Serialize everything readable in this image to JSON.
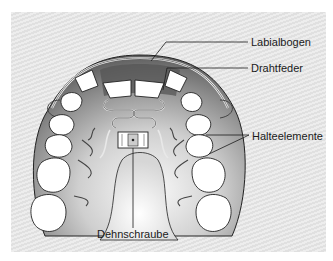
{
  "diagram": {
    "labels": [
      {
        "id": "labialbogen",
        "text": "Labialbogen"
      },
      {
        "id": "drahtfeder",
        "text": "Drahtfeder"
      },
      {
        "id": "halteelemente",
        "text": "Halteelemente"
      },
      {
        "id": "dehnschraube",
        "text": "Dehnschraube"
      }
    ]
  },
  "colors": {
    "background": "#ffffff",
    "panel": "#e4e4e4",
    "plate_dark": "#6e6e6e",
    "plate_light": "#f4f4f4",
    "teeth": "#ffffff",
    "lines": "#1a1a1a"
  }
}
